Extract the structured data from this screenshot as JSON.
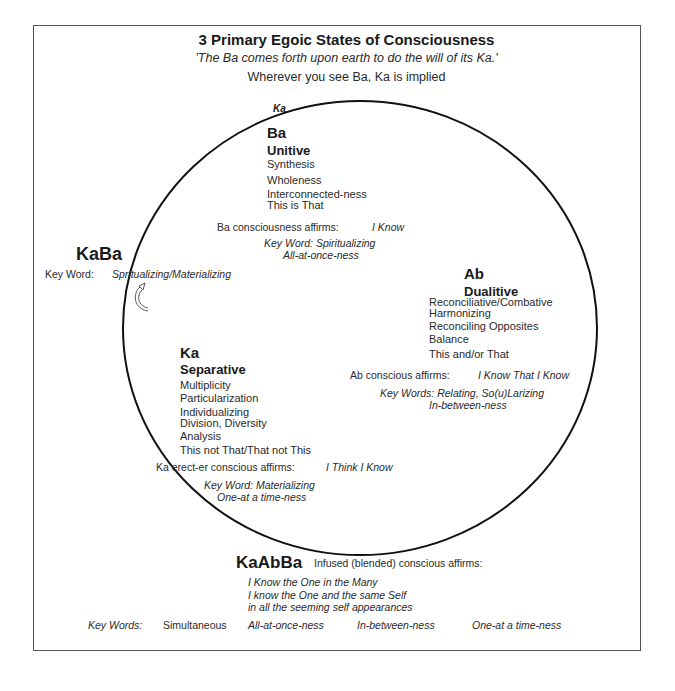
{
  "header": {
    "title": "3 Primary Egoic States of Consciousness",
    "quote": "'The Ba comes forth upon earth to do the will of its Ka.'",
    "note": "Wherever you see Ba, Ka is implied"
  },
  "circle_label": "Ka",
  "ba": {
    "name": "Ba",
    "state": "Unitive",
    "traits": [
      "Synthesis",
      "Wholeness",
      "Interconnected-ness",
      "This is That"
    ],
    "affirm_label": "Ba consciousness affirms:",
    "affirm_value": "I Know",
    "key_word": "Key Word: Spiritualizing",
    "ness": "All-at-once-ness"
  },
  "kaba": {
    "name": "KaBa",
    "key_label": "Key Word:",
    "key_value": "Spritualizing/Materializing",
    "arrow_icon": "curved-arrow-icon"
  },
  "ab": {
    "name": "Ab",
    "state": "Dualitive",
    "traits": [
      "Reconciliative/Combative",
      "Harmonizing",
      "Reconciling Opposites",
      "Balance",
      "This and/or That"
    ],
    "affirm_label": "Ab conscious affirms:",
    "affirm_value": "I Know That I Know",
    "key_word": "Key Words: Relating, So(u)Larizing",
    "ness": "In-between-ness"
  },
  "ka": {
    "name": "Ka",
    "state": "Separative",
    "traits": [
      "Multiplicity",
      "Particularization",
      "Individualizing",
      "Division, Diversity",
      "Analysis",
      "This not That/That not This"
    ],
    "affirm_label": "Ka erect-er  conscious affirms:",
    "affirm_value": "I Think I Know",
    "key_word": "Key Word: Materializing",
    "ness": "One-at a time-ness"
  },
  "kaabba": {
    "name": "KaAbBa",
    "affirm_label": "Infused (blended) conscious affirms:",
    "affirms": [
      "I Know the One in the Many",
      "I know the One and the same Self",
      "in all the seeming self appearances"
    ]
  },
  "footer": {
    "key_label": "Key Words:",
    "words": [
      "Simultaneous",
      "All-at-once-ness",
      "In-between-ness",
      "One-at a time-ness"
    ]
  }
}
